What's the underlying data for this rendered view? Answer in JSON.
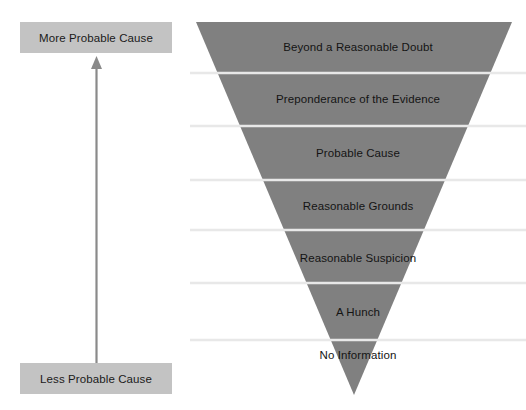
{
  "diagram": {
    "background_color": "#ffffff"
  },
  "axis": {
    "top_label": "More Probable Cause",
    "bottom_label": "Less Probable Cause",
    "box_color": "#c3c3c3",
    "arrow_color": "#8a8a8a",
    "arrow_direction": "up",
    "arrow_icon": "up-arrow-icon"
  },
  "pyramid": {
    "shape": "inverted-triangle",
    "fill_color": "#808080",
    "divider_color": "#e8e8e8",
    "tiers": [
      {
        "label": "Beyond a Reasonable Doubt",
        "rank": 1
      },
      {
        "label": "Preponderance of the Evidence",
        "rank": 2
      },
      {
        "label": "Probable Cause",
        "rank": 3
      },
      {
        "label": "Reasonable Grounds",
        "rank": 4
      },
      {
        "label": "Reasonable Suspicion",
        "rank": 5
      },
      {
        "label": "A Hunch",
        "rank": 6
      },
      {
        "label": "No Information",
        "rank": 7
      }
    ]
  }
}
